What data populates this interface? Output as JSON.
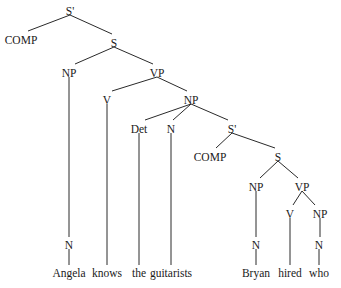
{
  "diagram": {
    "type": "syntax-tree",
    "nodes": [
      {
        "id": "sbar1",
        "label": "S'",
        "x": 70,
        "y": 12
      },
      {
        "id": "comp1",
        "label": "COMP",
        "x": 21,
        "y": 41
      },
      {
        "id": "s1",
        "label": "S",
        "x": 114,
        "y": 44
      },
      {
        "id": "np1",
        "label": "NP",
        "x": 69,
        "y": 74
      },
      {
        "id": "vp1",
        "label": "VP",
        "x": 157,
        "y": 74
      },
      {
        "id": "v1",
        "label": "V",
        "x": 107,
        "y": 101
      },
      {
        "id": "np2",
        "label": "NP",
        "x": 191,
        "y": 101
      },
      {
        "id": "det1",
        "label": "Det",
        "x": 139,
        "y": 130
      },
      {
        "id": "n2",
        "label": "N",
        "x": 171,
        "y": 130
      },
      {
        "id": "sbar2",
        "label": "S'",
        "x": 232,
        "y": 130
      },
      {
        "id": "comp2",
        "label": "COMP",
        "x": 210,
        "y": 158
      },
      {
        "id": "s2",
        "label": "S",
        "x": 278,
        "y": 158
      },
      {
        "id": "np3",
        "label": "NP",
        "x": 256,
        "y": 188
      },
      {
        "id": "vp2",
        "label": "VP",
        "x": 302,
        "y": 188
      },
      {
        "id": "v2",
        "label": "V",
        "x": 290,
        "y": 215
      },
      {
        "id": "np4",
        "label": "NP",
        "x": 320,
        "y": 215
      },
      {
        "id": "n1",
        "label": "N",
        "x": 69,
        "y": 246
      },
      {
        "id": "n3",
        "label": "N",
        "x": 256,
        "y": 246
      },
      {
        "id": "n4",
        "label": "N",
        "x": 319,
        "y": 246
      }
    ],
    "words": [
      {
        "id": "w1",
        "label": "Angela",
        "x": 69,
        "y": 274
      },
      {
        "id": "w2",
        "label": "knows",
        "x": 107,
        "y": 274
      },
      {
        "id": "w3",
        "label": "the",
        "x": 139,
        "y": 274
      },
      {
        "id": "w4",
        "label": "guitarists",
        "x": 171,
        "y": 274
      },
      {
        "id": "w5",
        "label": "Bryan",
        "x": 256,
        "y": 274
      },
      {
        "id": "w6",
        "label": "hired",
        "x": 290,
        "y": 274
      },
      {
        "id": "w7",
        "label": "who",
        "x": 319,
        "y": 274
      }
    ],
    "edges": [
      [
        70,
        15,
        28,
        31
      ],
      [
        70,
        15,
        112,
        34
      ],
      [
        114,
        47,
        75,
        64
      ],
      [
        114,
        47,
        153,
        64
      ],
      [
        69,
        77,
        69,
        237
      ],
      [
        157,
        77,
        112,
        91
      ],
      [
        157,
        77,
        187,
        91
      ],
      [
        107,
        104,
        107,
        265
      ],
      [
        191,
        104,
        145,
        120
      ],
      [
        191,
        104,
        173,
        120
      ],
      [
        191,
        104,
        228,
        120
      ],
      [
        139,
        133,
        139,
        265
      ],
      [
        171,
        133,
        171,
        265
      ],
      [
        232,
        133,
        216,
        148
      ],
      [
        232,
        133,
        275,
        148
      ],
      [
        278,
        161,
        260,
        178
      ],
      [
        278,
        161,
        298,
        178
      ],
      [
        256,
        191,
        256,
        237
      ],
      [
        302,
        191,
        293,
        205
      ],
      [
        302,
        191,
        315,
        205
      ],
      [
        290,
        218,
        290,
        265
      ],
      [
        320,
        218,
        320,
        237
      ],
      [
        69,
        249,
        69,
        265
      ],
      [
        256,
        249,
        256,
        265
      ],
      [
        319,
        249,
        319,
        265
      ]
    ]
  }
}
